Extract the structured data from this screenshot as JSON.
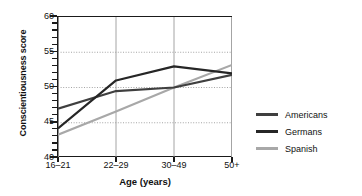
{
  "chart_data": {
    "type": "line",
    "title": "",
    "xlabel": "Age (years)",
    "ylabel": "Conscientiousness score",
    "categories": [
      "16–21",
      "22–29",
      "30–49",
      "50+"
    ],
    "ylim": [
      40,
      60
    ],
    "yticks": [
      40,
      45,
      50,
      55,
      60
    ],
    "ytick_labels": [
      "40",
      "45",
      "50",
      "55",
      "60"
    ],
    "minor_tick_step": 1,
    "grid": {
      "horizontal": "dotted",
      "vertical": "solid",
      "horizontal_at": [
        45,
        50,
        55
      ],
      "vertical_at": [
        "16–21",
        "22–29",
        "30–49",
        "50+"
      ]
    },
    "legend_position": "right",
    "series": [
      {
        "name": "Americans",
        "color": "#3f3f3f",
        "values": [
          47.0,
          49.5,
          50.0,
          51.8
        ]
      },
      {
        "name": "Germans",
        "color": "#262626",
        "values": [
          44.2,
          51.0,
          53.0,
          52.0
        ]
      },
      {
        "name": "Spanish",
        "color": "#a8a8a8",
        "values": [
          43.3,
          46.6,
          50.0,
          53.2
        ]
      }
    ]
  },
  "axes": {
    "y_title": "Conscientiousness score",
    "x_title": "Age (years)",
    "y_tick_labels": [
      "60",
      "55",
      "50",
      "45",
      "40"
    ],
    "x_tick_labels": [
      "16–21",
      "22–29",
      "30–49",
      "50+"
    ]
  },
  "legend": {
    "items": [
      {
        "label": "Americans",
        "color": "#3f3f3f"
      },
      {
        "label": "Germans",
        "color": "#262626"
      },
      {
        "label": "Spanish",
        "color": "#a8a8a8"
      }
    ]
  }
}
